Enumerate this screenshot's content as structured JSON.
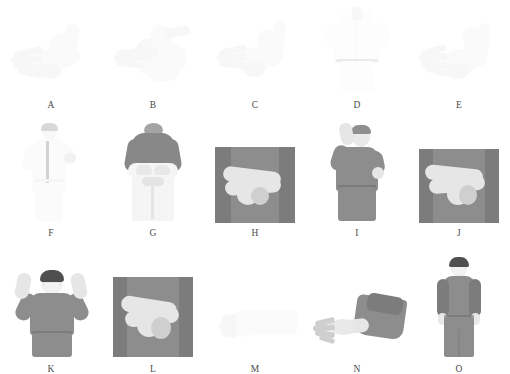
{
  "figure": {
    "layout": {
      "rows": 3,
      "columns": 5,
      "total_panels": 15
    },
    "style": {
      "background": "#ffffff",
      "caption_color": "#4a4a4a",
      "gown_gray": "#8d8d8d",
      "glove_white": "#e6e6e6",
      "hair_dark": "#4f4f4f"
    },
    "rows": [
      {
        "index": 1,
        "panels": [
          {
            "label": "A",
            "subject": "gloved-hands-closeup",
            "tone": "very-faint",
            "description": "Two hands, fingers spread, overlapping at wrist"
          },
          {
            "label": "B",
            "subject": "gloved-hands-closeup",
            "tone": "very-faint",
            "description": "Hands gripping cuff of sleeve"
          },
          {
            "label": "C",
            "subject": "gloved-hands-closeup",
            "tone": "very-faint",
            "description": "Hand pulling glove over wrist"
          },
          {
            "label": "D",
            "subject": "torso-front-gown",
            "tone": "very-faint",
            "description": "Person in white gown, front view, hands at shoulders"
          },
          {
            "label": "E",
            "subject": "gloved-hands-closeup",
            "tone": "very-faint",
            "description": "Both hands interlocked, fingers spread"
          }
        ]
      },
      {
        "index": 2,
        "panels": [
          {
            "label": "F",
            "subject": "person-white-gown-side",
            "tone": "faint",
            "description": "Standing person in white gown, side view, arm raised"
          },
          {
            "label": "G",
            "subject": "person-back-view",
            "tone": "mid",
            "description": "Back view, dark top, white gown tied at waist"
          },
          {
            "label": "H",
            "subject": "torso-crossed-arms",
            "tone": "mid",
            "description": "Torso in gray gown, gloved forearms crossed"
          },
          {
            "label": "I",
            "subject": "person-hand-raised",
            "tone": "mid",
            "description": "Person in gray gown, one gloved hand raised beside head"
          },
          {
            "label": "J",
            "subject": "torso-crossed-arms",
            "tone": "mid",
            "description": "Torso in gray gown, gloved hands clasped at waist"
          }
        ]
      },
      {
        "index": 3,
        "panels": [
          {
            "label": "K",
            "subject": "person-arms-up",
            "tone": "mid",
            "description": "Person in gray gown with mask, both arms raised, thumbs up"
          },
          {
            "label": "L",
            "subject": "torso-crossed-arms",
            "tone": "mid",
            "description": "Torso in gray gown, gloved hands crossed over abdomen"
          },
          {
            "label": "M",
            "subject": "hand-closeup",
            "tone": "very-faint",
            "description": "Close-up of a bare hand and forearm"
          },
          {
            "label": "N",
            "subject": "arm-extended",
            "tone": "mid",
            "description": "Gray-sleeved arm extended, bare hand, fingers spread"
          },
          {
            "label": "O",
            "subject": "person-full-body",
            "tone": "mid",
            "description": "Full-body front view, gray gown, white face mask, arms at sides"
          }
        ]
      }
    ]
  }
}
